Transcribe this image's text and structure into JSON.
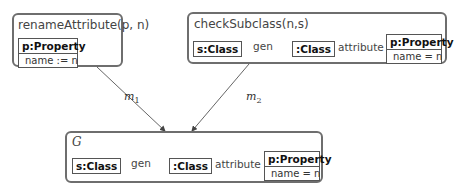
{
  "rules": {
    "rename": {
      "title": "renameAttribute(p, n)",
      "node": {
        "header": "p:Property",
        "attr": "name := n"
      }
    },
    "check": {
      "title": "checkSubclass(n,s)",
      "nodes": {
        "s_class": "s:Class",
        "anon_class": ":Class",
        "property": {
          "header": "p:Property",
          "attr": "name = n"
        }
      },
      "edges": {
        "gen": "gen",
        "attribute": "attribute"
      }
    },
    "graph": {
      "title": "G",
      "nodes": {
        "s_class": "s:Class",
        "anon_class": ":Class",
        "property": {
          "header": "p:Property",
          "attr": "name = n"
        }
      },
      "edges": {
        "gen": "gen",
        "attribute": "attribute"
      }
    }
  },
  "morphisms": {
    "m1": {
      "base": "m",
      "sub": "1"
    },
    "m2": {
      "base": "m",
      "sub": "2"
    }
  },
  "colors": {
    "border": "#6e6e6e",
    "line": "#555555"
  }
}
